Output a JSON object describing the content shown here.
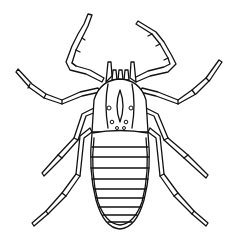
{
  "illustration": {
    "subject": "arachnid line drawing (pseudoscorpion-like), dorsal view",
    "style": "black ink outline on white",
    "colors": {
      "background": "#ffffff",
      "ink": "#111111"
    },
    "parts": {
      "legs_count": 8,
      "abdomen_segments": 9,
      "head_eye_spots": 6
    }
  }
}
